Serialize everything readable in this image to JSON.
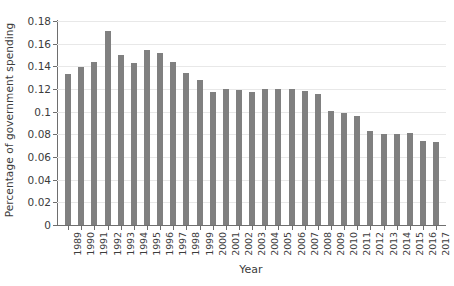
{
  "chart_data": {
    "type": "bar",
    "title": "",
    "xlabel": "Year",
    "ylabel": "Percentage of government spending",
    "ylim": [
      0,
      0.18
    ],
    "yticks": [
      0,
      0.02,
      0.04,
      0.06,
      0.08,
      0.1,
      0.12,
      0.14,
      0.16,
      0.18
    ],
    "ytick_labels": [
      "0",
      "0.02",
      "0.04",
      "0.06",
      "0.08",
      "0.1",
      "0.12",
      "0.14",
      "0.16",
      "0.18"
    ],
    "grid": true,
    "legend": "none",
    "bar_color": "#808080",
    "categories": [
      "1989",
      "1990",
      "1991",
      "1992",
      "1993",
      "1994",
      "1995",
      "1996",
      "1997",
      "1998",
      "1999",
      "2000",
      "2001",
      "2002",
      "2003",
      "2004",
      "2005",
      "2006",
      "2007",
      "2008",
      "2009",
      "2010",
      "2011",
      "2012",
      "2013",
      "2014",
      "2015",
      "2016",
      "2017"
    ],
    "values": [
      0.133,
      0.139,
      0.144,
      0.171,
      0.15,
      0.143,
      0.154,
      0.152,
      0.144,
      0.134,
      0.128,
      0.117,
      0.12,
      0.119,
      0.117,
      0.12,
      0.12,
      0.12,
      0.118,
      0.116,
      0.101,
      0.099,
      0.096,
      0.083,
      0.08,
      0.08,
      0.081,
      0.074,
      0.073
    ]
  }
}
